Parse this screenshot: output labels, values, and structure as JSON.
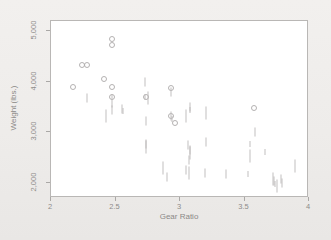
{
  "chart_data": {
    "type": "scatter",
    "title": "",
    "xlabel": "Gear Ratio",
    "ylabel": "Weight (lbs.)",
    "xlim": [
      2,
      4
    ],
    "ylim": [
      1700,
      5200
    ],
    "xticks": [
      2,
      2.5,
      3,
      3.5,
      4
    ],
    "xticklabels": [
      "2",
      "2.5",
      "3",
      "3.5",
      "4"
    ],
    "yticks": [
      2000,
      3000,
      4000,
      5000
    ],
    "yticklabels": [
      "2,000",
      "3,000",
      "4,000",
      "5,000"
    ],
    "grid": false,
    "legend": false,
    "marker_colors": {
      "circle": "#b0aeae",
      "tick": "#bdbbbb"
    },
    "series": [
      {
        "name": "circle-marked observations",
        "marker": "circle",
        "points": [
          {
            "x": 2.47,
            "y": 4840
          },
          {
            "x": 2.47,
            "y": 4720
          },
          {
            "x": 2.24,
            "y": 4330
          },
          {
            "x": 2.28,
            "y": 4330
          },
          {
            "x": 2.41,
            "y": 4060
          },
          {
            "x": 2.17,
            "y": 3900
          },
          {
            "x": 2.47,
            "y": 3900
          },
          {
            "x": 2.93,
            "y": 3880
          },
          {
            "x": 2.47,
            "y": 3690
          },
          {
            "x": 2.74,
            "y": 3690
          },
          {
            "x": 2.93,
            "y": 3330
          },
          {
            "x": 2.96,
            "y": 3190
          },
          {
            "x": 3.57,
            "y": 3470
          }
        ]
      },
      {
        "name": "tick-marked observations",
        "marker": "tick",
        "points": [
          {
            "x": 2.28,
            "y": 3680
          },
          {
            "x": 2.47,
            "y": 3620
          },
          {
            "x": 2.47,
            "y": 3440
          },
          {
            "x": 2.55,
            "y": 3460
          },
          {
            "x": 2.56,
            "y": 3420
          },
          {
            "x": 2.43,
            "y": 3320
          },
          {
            "x": 2.73,
            "y": 4000
          },
          {
            "x": 2.73,
            "y": 3700
          },
          {
            "x": 2.75,
            "y": 3680
          },
          {
            "x": 2.74,
            "y": 3230
          },
          {
            "x": 2.74,
            "y": 2760
          },
          {
            "x": 2.74,
            "y": 2700
          },
          {
            "x": 2.93,
            "y": 3800
          },
          {
            "x": 2.93,
            "y": 3330
          },
          {
            "x": 2.94,
            "y": 3270
          },
          {
            "x": 3.05,
            "y": 3320
          },
          {
            "x": 3.08,
            "y": 3490
          },
          {
            "x": 3.08,
            "y": 3440
          },
          {
            "x": 3.2,
            "y": 3390
          },
          {
            "x": 3.06,
            "y": 2740
          },
          {
            "x": 3.08,
            "y": 2650
          },
          {
            "x": 3.08,
            "y": 2590
          },
          {
            "x": 3.07,
            "y": 2460
          },
          {
            "x": 3.2,
            "y": 2810
          },
          {
            "x": 3.54,
            "y": 2760
          },
          {
            "x": 3.54,
            "y": 2530
          },
          {
            "x": 3.58,
            "y": 3000
          },
          {
            "x": 3.66,
            "y": 2610
          },
          {
            "x": 2.87,
            "y": 2290
          },
          {
            "x": 2.9,
            "y": 2120
          },
          {
            "x": 3.05,
            "y": 2250
          },
          {
            "x": 3.07,
            "y": 2190
          },
          {
            "x": 3.19,
            "y": 2190
          },
          {
            "x": 3.36,
            "y": 2180
          },
          {
            "x": 3.53,
            "y": 2180
          },
          {
            "x": 3.72,
            "y": 2070
          },
          {
            "x": 3.73,
            "y": 2040
          },
          {
            "x": 3.74,
            "y": 1980
          },
          {
            "x": 3.75,
            "y": 1930
          },
          {
            "x": 3.78,
            "y": 2070
          },
          {
            "x": 3.79,
            "y": 1990
          },
          {
            "x": 3.89,
            "y": 2330
          }
        ]
      }
    ]
  }
}
